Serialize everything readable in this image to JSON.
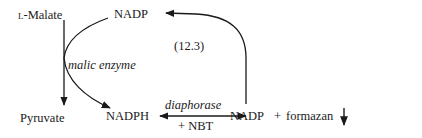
{
  "diagram": {
    "equation_number": "(12.3)",
    "nodes": {
      "l_malate_prefix": "L",
      "l_malate_rest": "-Malate",
      "nadp_top": "NADP",
      "pyruvate": "Pyruvate",
      "nadph": "NADPH",
      "nadp_product": "NADP",
      "plus": "+",
      "formazan": "formazan"
    },
    "enzymes": {
      "malic_enzyme": "malic enzyme",
      "diaphorase": "diaphorase",
      "cofactor": "+ NBT"
    },
    "edges": [
      {
        "from": "L-Malate",
        "to": "Pyruvate",
        "label": "malic enzyme"
      },
      {
        "from": "NADP",
        "to": "NADPH",
        "label": "malic enzyme"
      },
      {
        "from": "NADPH",
        "to": "NADP + formazan",
        "label": "diaphorase + NBT",
        "bidirectional": true
      },
      {
        "from": "NADP + formazan",
        "to": "NADP",
        "label": ""
      }
    ],
    "precipitate_symbol": "↓"
  }
}
